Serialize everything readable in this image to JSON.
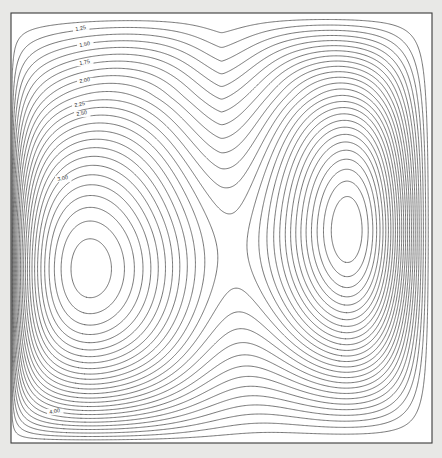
{
  "figure": {
    "title": "",
    "background_color": "#e8e8e6",
    "plot_background_color": "#ffffff",
    "frame_color": "#3a3a3a",
    "contour_color": "#4a4a4a"
  },
  "chart_data": {
    "type": "line",
    "subtype": "contour",
    "title": "",
    "xlabel": "",
    "ylabel": "",
    "xlim": [
      0,
      1
    ],
    "ylim": [
      0,
      1
    ],
    "grid": false,
    "legend": null,
    "axis_ticks_visible": false,
    "contour_levels": [
      0.25,
      0.5,
      0.75,
      1.0,
      1.25,
      1.5,
      1.75,
      2.0,
      2.25,
      2.5,
      2.75,
      3.0,
      3.25,
      3.5,
      3.75,
      4.0,
      4.25,
      4.5,
      4.75,
      5.0,
      5.25,
      5.5,
      5.75,
      6.0,
      6.25,
      6.5,
      6.75,
      7.0
    ],
    "contour_interval": 0.25,
    "labeled_levels": [
      {
        "value": "1.25",
        "x": 81,
        "y": 30
      },
      {
        "value": "1.50",
        "x": 85,
        "y": 46
      },
      {
        "value": "1.75",
        "x": 85,
        "y": 64
      },
      {
        "value": "2.00",
        "x": 85,
        "y": 82
      },
      {
        "value": "2.25",
        "x": 80,
        "y": 106
      },
      {
        "value": "2.50",
        "x": 82,
        "y": 115
      },
      {
        "value": "3.00",
        "x": 63,
        "y": 180
      },
      {
        "value": "4.00",
        "x": 55,
        "y": 413
      }
    ],
    "features": [
      {
        "name": "left-vortex-core",
        "x_px": 100,
        "y_px": 282,
        "x_data": 0.215,
        "y_data": 0.405
      },
      {
        "name": "right-vortex-core",
        "x_px": 342,
        "y_px": 240,
        "x_data": 0.79,
        "y_data": 0.495
      },
      {
        "name": "saddle-point",
        "x_px": 221,
        "y_px": 98,
        "x_data": 0.5,
        "y_data": 0.805
      }
    ],
    "series": [
      {
        "name": "left-cell",
        "values": [
          0.25,
          0.5,
          0.75,
          1.0,
          1.25,
          1.5,
          1.75,
          2.0,
          2.25,
          2.5,
          2.75,
          3.0,
          3.25,
          3.5,
          3.75,
          4.0,
          4.25,
          4.5,
          4.75,
          5.0,
          5.25,
          5.5,
          5.75,
          6.0,
          6.25,
          6.5,
          6.75,
          7.0
        ]
      },
      {
        "name": "right-cell",
        "values": [
          0.25,
          0.5,
          0.75,
          1.0,
          1.25,
          1.5,
          1.75,
          2.0,
          2.25,
          2.5,
          2.75,
          3.0,
          3.25,
          3.5,
          3.75,
          4.0,
          4.25,
          4.5,
          4.75,
          5.0,
          5.25,
          5.5,
          5.75,
          6.0,
          6.25,
          6.5,
          6.75,
          7.0
        ]
      }
    ]
  },
  "frame": {
    "left": 11,
    "top": 13,
    "right": 432,
    "bottom": 443
  }
}
